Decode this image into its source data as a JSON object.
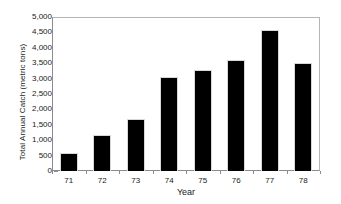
{
  "chart_data": {
    "type": "bar",
    "title": "",
    "subtitle": "",
    "xlabel": "Year",
    "ylabel": "Total Annual Catch (metric tons)",
    "categories": [
      "71",
      "72",
      "73",
      "74",
      "75",
      "76",
      "77",
      "78"
    ],
    "values": [
      560,
      1140,
      1650,
      3020,
      3240,
      3570,
      4550,
      3490
    ],
    "series": [
      {
        "name": "Total Annual Catch",
        "values": [
          560,
          1140,
          1650,
          3020,
          3240,
          3570,
          4550,
          3490
        ]
      }
    ],
    "ylim": [
      0,
      5000
    ],
    "y_tick_step": 500,
    "y_ticks": [
      5000,
      4500,
      4000,
      3500,
      3000,
      2500,
      2000,
      1500,
      1000,
      500,
      0
    ],
    "y_tick_labels": [
      "5,000",
      "4,500",
      "4,000",
      "3,500",
      "3,000",
      "2,500",
      "2,000",
      "1,500",
      "1,000",
      "500",
      "0"
    ],
    "grid": false,
    "legend": false,
    "legend_position": "none",
    "bar_color": "#000000",
    "axis_color": "#8c8c8c",
    "background_color": "#ffffff",
    "text_color": "#1a1a1a"
  }
}
